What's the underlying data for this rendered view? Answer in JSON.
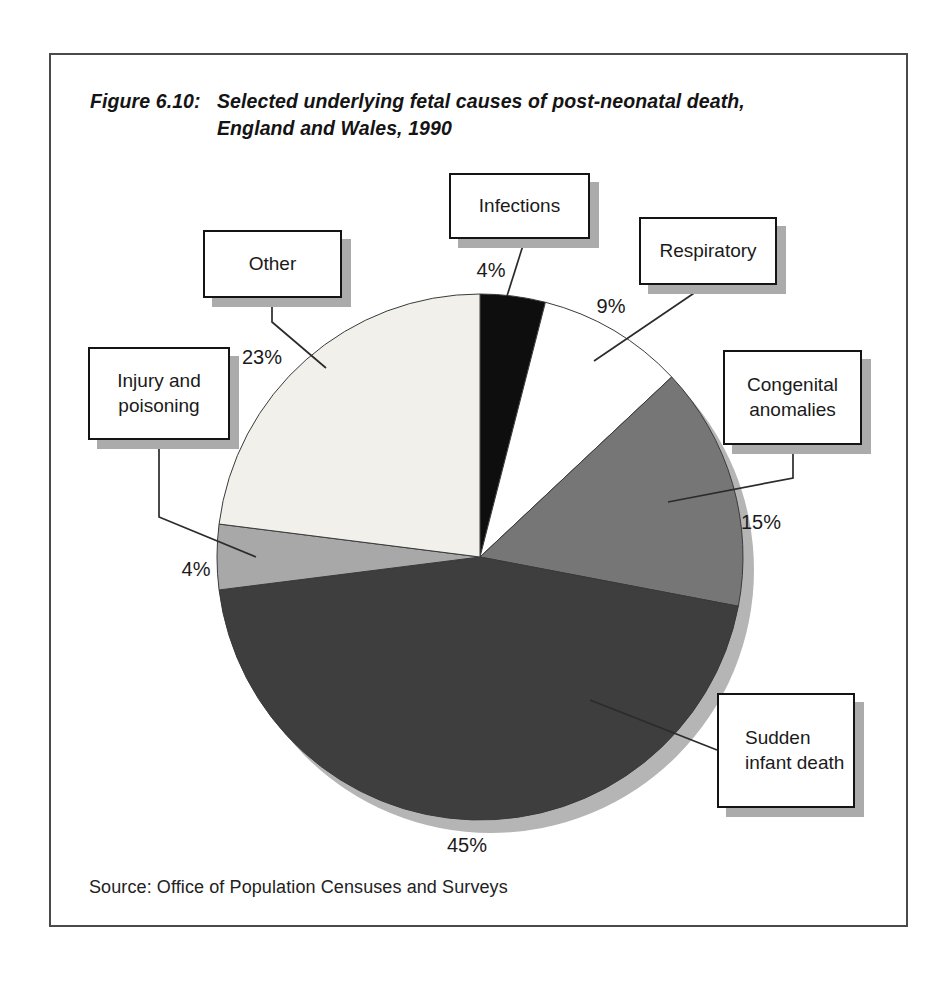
{
  "figure": {
    "label": "Figure 6.10:",
    "title_line1": "Selected underlying fetal causes of post-neonatal death,",
    "title_line2": "England and Wales, 1990",
    "source": "Source: Office of Population Censuses and Surveys"
  },
  "chart_data": {
    "type": "pie",
    "title": "Selected underlying fetal causes of post-neonatal death, England and Wales, 1990",
    "source": "Office of Population Censuses and Surveys",
    "unit": "%",
    "direction": "clockwise",
    "start_angle_deg_from_top": 0,
    "legend_position": "callout-boxes-around-pie",
    "categories": [
      "Infections",
      "Respiratory",
      "Congenital anomalies",
      "Sudden infant death",
      "Injury and poisoning",
      "Other"
    ],
    "values": [
      4,
      9,
      15,
      45,
      4,
      23
    ],
    "slices": [
      {
        "label": "Infections",
        "value": 4,
        "pct_text": "4%",
        "color": "#0e0e0e"
      },
      {
        "label": "Respiratory",
        "value": 9,
        "pct_text": "9%",
        "color": "#ffffff"
      },
      {
        "label": "Congenital anomalies",
        "value": 15,
        "pct_text": "15%",
        "color": "#767676"
      },
      {
        "label": "Sudden infant death",
        "value": 45,
        "pct_text": "45%",
        "color": "#3e3e3e"
      },
      {
        "label": "Injury and poisoning",
        "value": 4,
        "pct_text": "4%",
        "color": "#a8a8a8"
      },
      {
        "label": "Other",
        "value": 23,
        "pct_text": "23%",
        "color": "#f1f0eb"
      }
    ],
    "colors": {
      "pie_shadow": "#b5b5b5",
      "slice_outline": "#3a3a3a",
      "leader_line": "#2b2b2b",
      "box_border": "#141414",
      "box_shadow": "#ababab"
    }
  }
}
